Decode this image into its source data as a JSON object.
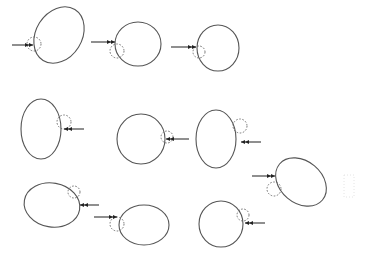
{
  "diagram": {
    "width": 369,
    "height": 259,
    "stroke_color": "#555555",
    "bump_color": "#666666",
    "arrow_color": "#222222",
    "cells": [
      {
        "id": 1,
        "cx": 59,
        "cy": 35,
        "rx": 23,
        "ry": 30,
        "rot": 32,
        "bump": {
          "x": 34,
          "y": 44,
          "r": 7
        },
        "arrow": {
          "x1": 12,
          "y1": 45,
          "x2": 33,
          "y2": 45
        }
      },
      {
        "id": 2,
        "cx": 138,
        "cy": 44,
        "rx": 23,
        "ry": 22,
        "rot": 0,
        "bump": {
          "x": 117,
          "y": 51,
          "r": 7
        },
        "arrow": {
          "x1": 91,
          "y1": 42,
          "x2": 115,
          "y2": 42
        }
      },
      {
        "id": 3,
        "cx": 218,
        "cy": 48,
        "rx": 21,
        "ry": 23,
        "rot": 0,
        "bump": {
          "x": 199,
          "y": 52,
          "r": 6
        },
        "arrow": {
          "x1": 171,
          "y1": 47,
          "x2": 196,
          "y2": 47
        }
      },
      {
        "id": 4,
        "cx": 41,
        "cy": 129,
        "rx": 20,
        "ry": 30,
        "rot": 0,
        "bump": {
          "x": 64,
          "y": 122,
          "r": 7
        },
        "arrow": {
          "x1": 84,
          "y1": 129,
          "x2": 64,
          "y2": 129
        }
      },
      {
        "id": 5,
        "cx": 141,
        "cy": 139,
        "rx": 24,
        "ry": 25,
        "rot": 0,
        "bump": {
          "x": 167,
          "y": 137,
          "r": 6
        },
        "arrow": {
          "x1": 189,
          "y1": 139,
          "x2": 166,
          "y2": 139
        }
      },
      {
        "id": 6,
        "cx": 216,
        "cy": 139,
        "rx": 20,
        "ry": 29,
        "rot": 0,
        "bump": {
          "x": 240,
          "y": 126,
          "r": 7
        },
        "arrow": {
          "x1": 261,
          "y1": 142,
          "x2": 241,
          "y2": 142
        }
      },
      {
        "id": 7,
        "cx": 301,
        "cy": 182,
        "rx": 28,
        "ry": 21,
        "rot": 40,
        "bump": {
          "x": 274,
          "y": 189,
          "r": 7
        },
        "arrow": {
          "x1": 252,
          "y1": 176,
          "x2": 275,
          "y2": 176
        }
      },
      {
        "id": 8,
        "cx": 52,
        "cy": 205,
        "rx": 28,
        "ry": 22,
        "rot": 10,
        "bump": {
          "x": 74,
          "y": 192,
          "r": 6
        },
        "arrow": {
          "x1": 99,
          "y1": 205,
          "x2": 80,
          "y2": 205
        }
      },
      {
        "id": 9,
        "cx": 144,
        "cy": 225,
        "rx": 25,
        "ry": 20,
        "rot": 0,
        "bump": {
          "x": 117,
          "y": 224,
          "r": 7
        },
        "arrow": {
          "x1": 94,
          "y1": 217,
          "x2": 117,
          "y2": 217
        }
      },
      {
        "id": 10,
        "cx": 221,
        "cy": 224,
        "rx": 22,
        "ry": 23,
        "rot": 0,
        "bump": {
          "x": 243,
          "y": 215,
          "r": 6
        },
        "arrow": {
          "x1": 265,
          "y1": 223,
          "x2": 245,
          "y2": 223
        }
      }
    ],
    "faint_mark": {
      "x": 344,
      "y": 175,
      "w": 10,
      "h": 22
    }
  }
}
